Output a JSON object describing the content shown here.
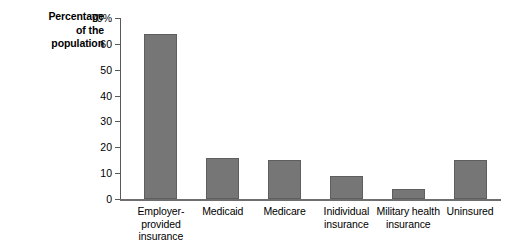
{
  "chart_data": {
    "type": "bar",
    "title": "",
    "xlabel": "",
    "ylabel": "Percentage of the population",
    "ylabel_lines": [
      "Percentage",
      "of the",
      "population"
    ],
    "categories": [
      "Employer-provided insurance",
      "Medicaid",
      "Medicare",
      "Inidividual insurance",
      "Military health insurance",
      "Uninsured"
    ],
    "category_lines": [
      [
        "Employer-provided",
        "insurance"
      ],
      [
        "Medicaid"
      ],
      [
        "Medicare"
      ],
      [
        "Inidividual",
        "insurance"
      ],
      [
        "Military health",
        "insurance"
      ],
      [
        "Uninsured"
      ]
    ],
    "values": [
      64,
      16,
      15,
      9,
      4,
      15
    ],
    "ylim": [
      0,
      70
    ],
    "yticks": [
      0,
      10,
      20,
      30,
      40,
      50,
      60,
      70
    ],
    "ytick_labels": [
      "0",
      "10",
      "20",
      "30",
      "40",
      "50",
      "60",
      "70%"
    ],
    "grid": false,
    "legend": null,
    "bar_color": "#767676",
    "bar_edge_color": "#5e5e5e",
    "axis_color": "#5a5a5a",
    "text_color": "#000000",
    "background": "#ffffff"
  }
}
